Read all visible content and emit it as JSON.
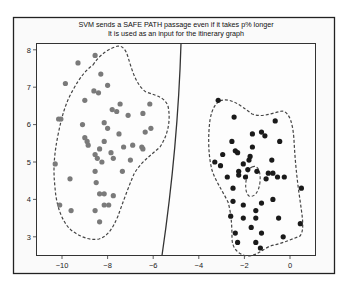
{
  "chart_data": {
    "type": "scatter",
    "title": "SVM sends a SAFE PATH passage even if it takes p% longer",
    "subtitle": "It is used as an input for the itinerary graph",
    "xlabel": "",
    "ylabel": "",
    "xlim": [
      -11.2,
      1.1
    ],
    "ylim": [
      2.3,
      8.15
    ],
    "grid": false,
    "legend": null,
    "x_ticks": [
      "-10",
      "-8",
      "-6",
      "-4",
      "-2",
      "0"
    ],
    "x_tick_values": [
      -10,
      -8,
      -6,
      -4,
      -2,
      0
    ],
    "y_ticks": [
      "3",
      "4",
      "5",
      "6",
      "7",
      "8"
    ],
    "y_tick_values": [
      3,
      4,
      5,
      6,
      7,
      8
    ],
    "series": [
      {
        "name": "cluster-left",
        "color": "#7a7a7a",
        "points": [
          [
            -8.55,
            7.85
          ],
          [
            -9.3,
            7.65
          ],
          [
            -8.3,
            7.35
          ],
          [
            -9.85,
            7.1
          ],
          [
            -8.0,
            7.05
          ],
          [
            -8.6,
            6.9
          ],
          [
            -8.4,
            6.85
          ],
          [
            -9.0,
            6.65
          ],
          [
            -7.45,
            6.55
          ],
          [
            -7.8,
            6.4
          ],
          [
            -7.6,
            6.35
          ],
          [
            -10.05,
            6.15
          ],
          [
            -10.15,
            6.15
          ],
          [
            -7.1,
            6.25
          ],
          [
            -6.45,
            6.3
          ],
          [
            -6.15,
            6.55
          ],
          [
            -8.15,
            6.05
          ],
          [
            -9.1,
            6.0
          ],
          [
            -8.0,
            5.9
          ],
          [
            -7.5,
            5.75
          ],
          [
            -6.1,
            5.9
          ],
          [
            -6.35,
            5.8
          ],
          [
            -9.0,
            5.65
          ],
          [
            -8.9,
            5.55
          ],
          [
            -8.15,
            5.55
          ],
          [
            -8.85,
            5.45
          ],
          [
            -7.3,
            5.4
          ],
          [
            -6.9,
            5.45
          ],
          [
            -6.5,
            5.4
          ],
          [
            -6.45,
            5.35
          ],
          [
            -8.35,
            5.35
          ],
          [
            -7.85,
            5.25
          ],
          [
            -8.55,
            5.2
          ],
          [
            -8.45,
            5.1
          ],
          [
            -7.0,
            5.05
          ],
          [
            -7.75,
            5.1
          ],
          [
            -8.25,
            5.0
          ],
          [
            -10.3,
            4.95
          ],
          [
            -8.55,
            4.75
          ],
          [
            -7.35,
            4.75
          ],
          [
            -9.65,
            4.55
          ],
          [
            -8.5,
            4.45
          ],
          [
            -8.35,
            4.15
          ],
          [
            -8.15,
            4.15
          ],
          [
            -7.75,
            4.1
          ],
          [
            -8.15,
            3.85
          ],
          [
            -7.95,
            3.85
          ],
          [
            -10.1,
            3.85
          ],
          [
            -8.55,
            3.7
          ],
          [
            -8.35,
            3.4
          ],
          [
            -9.6,
            3.7
          ]
        ]
      },
      {
        "name": "cluster-right",
        "color": "#1a1a1a",
        "points": [
          [
            -3.15,
            6.65
          ],
          [
            -2.45,
            6.2
          ],
          [
            -0.65,
            6.1
          ],
          [
            -1.65,
            5.75
          ],
          [
            -1.25,
            5.8
          ],
          [
            -1.1,
            5.7
          ],
          [
            -2.55,
            5.55
          ],
          [
            -1.65,
            5.4
          ],
          [
            -0.45,
            5.55
          ],
          [
            -1.75,
            5.15
          ],
          [
            -2.95,
            5.2
          ],
          [
            -2.4,
            5.3
          ],
          [
            -2.3,
            5.25
          ],
          [
            -1.8,
            5.05
          ],
          [
            -0.8,
            5.05
          ],
          [
            -3.3,
            5.0
          ],
          [
            -3.05,
            4.9
          ],
          [
            -2.05,
            4.95
          ],
          [
            -2.25,
            4.75
          ],
          [
            -1.85,
            4.8
          ],
          [
            -1.45,
            4.75
          ],
          [
            -0.95,
            4.7
          ],
          [
            -0.75,
            4.7
          ],
          [
            -2.75,
            4.6
          ],
          [
            -2.25,
            4.65
          ],
          [
            -1.95,
            4.6
          ],
          [
            -0.55,
            4.6
          ],
          [
            -0.25,
            4.6
          ],
          [
            -1.05,
            4.55
          ],
          [
            -2.5,
            4.3
          ],
          [
            -2.5,
            3.95
          ],
          [
            -2.05,
            3.85
          ],
          [
            -0.75,
            4.0
          ],
          [
            -1.25,
            3.9
          ],
          [
            -1.5,
            3.7
          ],
          [
            -2.6,
            3.55
          ],
          [
            -2.05,
            3.5
          ],
          [
            -1.5,
            3.5
          ],
          [
            -0.5,
            3.5
          ],
          [
            -2.4,
            3.1
          ],
          [
            -1.7,
            3.25
          ],
          [
            -1.25,
            3.1
          ],
          [
            -1.5,
            2.85
          ],
          [
            -2.3,
            2.85
          ],
          [
            -1.3,
            2.7
          ],
          [
            0.45,
            3.35
          ],
          [
            0.5,
            4.3
          ],
          [
            -0.3,
            3.0
          ]
        ]
      }
    ],
    "annotations": [
      {
        "type": "decision-boundary",
        "description": "solid curved line from (-4.7, 8.15) to (-5.55, 2.3)"
      },
      {
        "type": "dashed-contour",
        "description": "dashed outline around left cluster"
      },
      {
        "type": "dashed-contour",
        "description": "dashed outline around right cluster with inner hole near (-1.7, 4.9)"
      }
    ]
  }
}
